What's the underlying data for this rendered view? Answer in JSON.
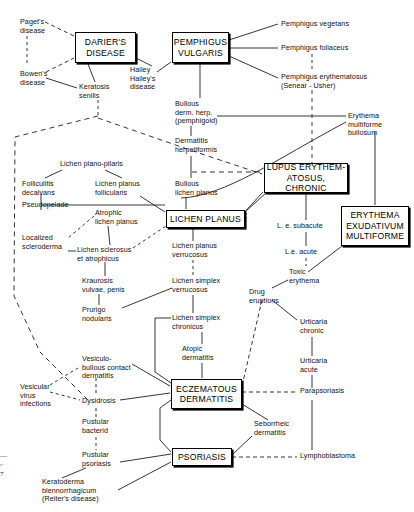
{
  "figure": {
    "width": 414,
    "height": 512,
    "line_color": "#111111",
    "box_border_color": "#000000",
    "background": "#ffffff"
  },
  "boxes": [
    {
      "id": "darier",
      "label": "DARIER'S\nDISEASE",
      "x": 75,
      "y": 32,
      "w": 61,
      "h": 31
    },
    {
      "id": "pemphigus",
      "label": "PEMPHIGUS\nVULGARIS",
      "x": 172,
      "y": 32,
      "w": 57,
      "h": 31
    },
    {
      "id": "lupus",
      "label": "LUPUS ERYTHEM-\nATOSUS, CHRONIC",
      "x": 264,
      "y": 163,
      "w": 84,
      "h": 30
    },
    {
      "id": "erythema",
      "label": "ERYTHEMA\nEXUDATIVUM\nMULTIFORME",
      "x": 341,
      "y": 206,
      "w": 68,
      "h": 40
    },
    {
      "id": "lichen",
      "label": "LICHEN PLANUS",
      "x": 166,
      "y": 210,
      "w": 79,
      "h": 18
    },
    {
      "id": "eczema",
      "label": "ECZEMATOUS\nDERMATITIS",
      "x": 171,
      "y": 379,
      "w": 71,
      "h": 30
    },
    {
      "id": "psoriasis",
      "label": "PSORIASIS",
      "x": 172,
      "y": 448,
      "w": 60,
      "h": 18
    }
  ],
  "labels": [
    {
      "id": "pagets",
      "text": "Paget's\ndisease",
      "x": 20,
      "y": 18,
      "align": "l"
    },
    {
      "id": "bowens",
      "text": "Bowen's\ndisease",
      "x": 20,
      "y": 70,
      "align": "l"
    },
    {
      "id": "keratosis",
      "text": "Keratosis\nsenilis",
      "x": 79,
      "y": 83,
      "align": "l"
    },
    {
      "id": "hailey",
      "text": "Hailey\nHailey's\ndisease",
      "x": 130,
      "y": 66,
      "align": "l"
    },
    {
      "id": "pemph_veg",
      "text": "Pemphigus vegetans",
      "x": 281,
      "y": 20,
      "align": "l"
    },
    {
      "id": "pemph_fol",
      "text": "Pemphigus foliaceus",
      "x": 281,
      "y": 44,
      "align": "l"
    },
    {
      "id": "pemph_ery",
      "text": "Pemphigus erythematosus\n(Senear - Usher)",
      "x": 281,
      "y": 73,
      "align": "l"
    },
    {
      "id": "bullous_dh",
      "text": "Bullous\nderm. herp.\n(pemphigoid)",
      "x": 175,
      "y": 100,
      "align": "l"
    },
    {
      "id": "erythema_mb",
      "text": "Erythema\nmultiforme\nbullosum",
      "x": 348,
      "y": 112,
      "align": "l"
    },
    {
      "id": "derm_herp",
      "text": "Dermatitis\nherpetiformis",
      "x": 175,
      "y": 137,
      "align": "l"
    },
    {
      "id": "lichen_plano",
      "text": "Lichen plano-pilaris",
      "x": 60,
      "y": 160,
      "align": "l"
    },
    {
      "id": "folliculitis",
      "text": "Folliculitis\ndecalvans",
      "x": 22,
      "y": 180,
      "align": "l"
    },
    {
      "id": "lichen_foll",
      "text": "Lichen planus\nfollicularis",
      "x": 95,
      "y": 180,
      "align": "l"
    },
    {
      "id": "bullous_lp",
      "text": "Bullous\nlichen planus",
      "x": 175,
      "y": 180,
      "align": "l"
    },
    {
      "id": "pseudopelade",
      "text": "Pseudopelade",
      "x": 22,
      "y": 212,
      "align": "l"
    },
    {
      "id": "atrophic_lp",
      "text": "Atrophic\nlichen planus",
      "x": 95,
      "y": 209,
      "align": "l"
    },
    {
      "id": "localized_scl",
      "text": "Localized\nscleroderma",
      "x": 22,
      "y": 234,
      "align": "l"
    },
    {
      "id": "lichen_scl",
      "text": "Lichen sclerosus\net atrophicus",
      "x": 77,
      "y": 246,
      "align": "l"
    },
    {
      "id": "lichen_verr",
      "text": "Lichen planus\nverrucosus",
      "x": 172,
      "y": 242,
      "align": "l"
    },
    {
      "id": "kraurosis",
      "text": "Kraurosis\nvulvae, penis",
      "x": 82,
      "y": 277,
      "align": "l"
    },
    {
      "id": "lichen_simp_v",
      "text": "Lichen simplex\nverrucosus",
      "x": 172,
      "y": 277,
      "align": "l"
    },
    {
      "id": "prurigo",
      "text": "Prurigo\nnodularis",
      "x": 82,
      "y": 306,
      "align": "l"
    },
    {
      "id": "lichen_simp_c",
      "text": "Lichen simplex\nchronicus",
      "x": 172,
      "y": 314,
      "align": "l"
    },
    {
      "id": "atopic_derm",
      "text": "Atopic\ndermatitis",
      "x": 182,
      "y": 345,
      "align": "l"
    },
    {
      "id": "vesic_bull",
      "text": "Vesiculo-\nbullous contact\ndermatitis",
      "x": 82,
      "y": 355,
      "align": "l"
    },
    {
      "id": "vesic_virus",
      "text": "Vesicular\nvirus\ninfections",
      "x": 20,
      "y": 383,
      "align": "l"
    },
    {
      "id": "dysidrosis",
      "text": "Dysidrosis",
      "x": 82,
      "y": 397,
      "align": "l"
    },
    {
      "id": "pustular_bac",
      "text": "Pustular\nbacterid",
      "x": 82,
      "y": 418,
      "align": "l"
    },
    {
      "id": "pustular_pso",
      "text": "Pustular\npsoriasis",
      "x": 82,
      "y": 451,
      "align": "l"
    },
    {
      "id": "keratoderma",
      "text": "Keratoderma\nblennorrhagicum\n(Reiter's disease)",
      "x": 42,
      "y": 478,
      "align": "l"
    },
    {
      "id": "le_subacute",
      "text": "L. e. subacute",
      "x": 277,
      "y": 222,
      "align": "l"
    },
    {
      "id": "le_acute",
      "text": "L.e. acute",
      "x": 285,
      "y": 248,
      "align": "l"
    },
    {
      "id": "toxic_ery",
      "text": "Toxic\nerythema",
      "x": 289,
      "y": 268,
      "align": "l"
    },
    {
      "id": "drug_erupt",
      "text": "Drug\neruptions",
      "x": 249,
      "y": 288,
      "align": "l"
    },
    {
      "id": "urticaria_chr",
      "text": "Urticaria\nchronic",
      "x": 300,
      "y": 318,
      "align": "l"
    },
    {
      "id": "urticaria_acu",
      "text": "Urticaria\nacute",
      "x": 300,
      "y": 357,
      "align": "l"
    },
    {
      "id": "parapsoriasis",
      "text": "Parapsoriasis",
      "x": 300,
      "y": 389,
      "align": "l"
    },
    {
      "id": "seborrheic",
      "text": "Seborrheic\ndermatitis",
      "x": 254,
      "y": 420,
      "align": "l"
    },
    {
      "id": "lymphoblast",
      "text": "Lymphoblastoma",
      "x": 300,
      "y": 451,
      "align": "l"
    }
  ],
  "edge_styles": {
    "solid": "solid",
    "dashed": "dashed"
  },
  "caption_fragment": "—\n⌐\n7"
}
